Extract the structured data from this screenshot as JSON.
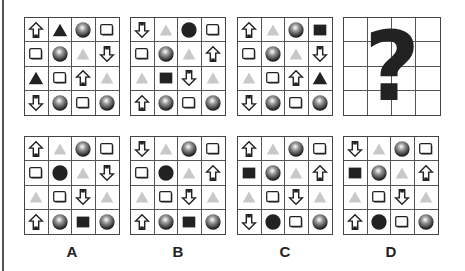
{
  "puzzle": {
    "legend": {
      "U": "up-arrow",
      "D": "down-arrow",
      "T": "black-triangle",
      "t": "grey-triangle",
      "S": "shaded-sphere",
      "C": "black-circle",
      "B": "white-box",
      "K": "black-square"
    },
    "question_grids": [
      {
        "name": "grid-1",
        "cells": [
          [
            "U",
            "T",
            "S",
            "B"
          ],
          [
            "B",
            "S",
            "t",
            "D"
          ],
          [
            "T",
            "B",
            "U",
            "t"
          ],
          [
            "D",
            "S",
            "B",
            "S"
          ]
        ]
      },
      {
        "name": "grid-2",
        "cells": [
          [
            "D",
            "t",
            "C",
            "B"
          ],
          [
            "B",
            "S",
            "t",
            "U"
          ],
          [
            "t",
            "K",
            "D",
            "t"
          ],
          [
            "U",
            "S",
            "B",
            "S"
          ]
        ]
      },
      {
        "name": "grid-3",
        "cells": [
          [
            "U",
            "t",
            "S",
            "K"
          ],
          [
            "B",
            "S",
            "t",
            "D"
          ],
          [
            "t",
            "B",
            "U",
            "T"
          ],
          [
            "D",
            "S",
            "B",
            "S"
          ]
        ]
      }
    ],
    "missing_symbol": "?",
    "options": [
      {
        "label": "A",
        "cells": [
          [
            "U",
            "t",
            "S",
            "B"
          ],
          [
            "B",
            "C",
            "t",
            "D"
          ],
          [
            "t",
            "B",
            "D",
            "t"
          ],
          [
            "U",
            "S",
            "K",
            "S"
          ]
        ]
      },
      {
        "label": "B",
        "cells": [
          [
            "D",
            "t",
            "S",
            "B"
          ],
          [
            "B",
            "C",
            "t",
            "U"
          ],
          [
            "t",
            "B",
            "D",
            "t"
          ],
          [
            "U",
            "S",
            "K",
            "S"
          ]
        ]
      },
      {
        "label": "C",
        "cells": [
          [
            "U",
            "t",
            "S",
            "B"
          ],
          [
            "K",
            "S",
            "t",
            "U"
          ],
          [
            "t",
            "B",
            "D",
            "t"
          ],
          [
            "D",
            "C",
            "B",
            "S"
          ]
        ]
      },
      {
        "label": "D",
        "cells": [
          [
            "D",
            "t",
            "S",
            "B"
          ],
          [
            "K",
            "S",
            "t",
            "U"
          ],
          [
            "t",
            "B",
            "D",
            "t"
          ],
          [
            "U",
            "C",
            "B",
            "S"
          ]
        ]
      }
    ],
    "colors": {
      "grid_line": "#555555",
      "black_shape": "#222222",
      "grey_triangle": "#c8c8c8",
      "background": "#ffffff"
    }
  }
}
